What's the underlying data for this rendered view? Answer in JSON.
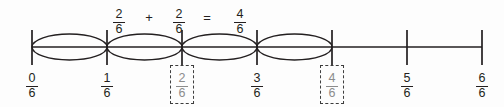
{
  "equation": {
    "term1": {
      "num": "2",
      "den": "6"
    },
    "plus": "+",
    "term2": {
      "num": "2",
      "den": "6"
    },
    "equals": "=",
    "result": {
      "num": "4",
      "den": "6"
    }
  },
  "number_line": {
    "tick_count": 7,
    "loop_count": 4,
    "labels": [
      {
        "num": "0",
        "den": "6",
        "boxed": false
      },
      {
        "num": "1",
        "den": "6",
        "boxed": false
      },
      {
        "num": "2",
        "den": "6",
        "boxed": true
      },
      {
        "num": "3",
        "den": "6",
        "boxed": false
      },
      {
        "num": "4",
        "den": "6",
        "boxed": true
      },
      {
        "num": "5",
        "den": "6",
        "boxed": false
      },
      {
        "num": "6",
        "den": "6",
        "boxed": false
      }
    ]
  },
  "colors": {
    "line": "#231f20",
    "label_text": "#231f20",
    "boxed_label_text": "#8c8c8c",
    "box_border": "#3c3c3c",
    "background": "#fdfdfd"
  }
}
